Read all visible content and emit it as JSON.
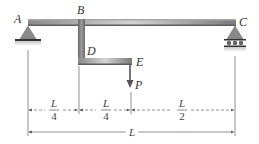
{
  "diagram": {
    "type": "beam-structure",
    "points": {
      "A": "A",
      "B": "B",
      "C": "C",
      "D": "D",
      "E": "E"
    },
    "load": {
      "label": "P",
      "direction": "down"
    },
    "supports": {
      "left": "pin",
      "right": "roller"
    },
    "dimensions": {
      "seg1": {
        "num": "L",
        "den": "4"
      },
      "seg2": {
        "num": "L",
        "den": "4"
      },
      "seg3": {
        "num": "L",
        "den": "2"
      },
      "total": "L"
    },
    "colors": {
      "beam_dark": "#6e6e6e",
      "beam_light": "#cfcfcf",
      "support": "#8a8a8a",
      "dimension_line": "#555555"
    }
  }
}
